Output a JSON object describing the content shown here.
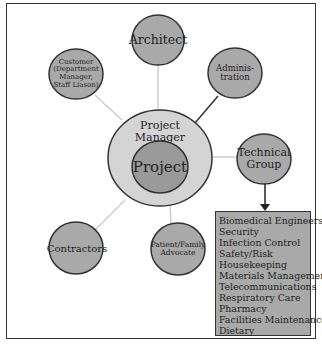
{
  "diagram": {
    "center": {
      "outer_label": "Project Manager",
      "inner_label": "Project"
    },
    "nodes": [
      {
        "id": "architect",
        "label": "Architect"
      },
      {
        "id": "customer",
        "label": "Customer (Department Manager, Staff Liason)"
      },
      {
        "id": "administration",
        "label": "Adminis-tration"
      },
      {
        "id": "technical-group",
        "label": "Technical Group"
      },
      {
        "id": "contractors",
        "label": "Contractors"
      },
      {
        "id": "patient-family-advocate",
        "label": "Patient/Family Advocate"
      }
    ],
    "technical_group_members": [
      "Biomedical Engineers",
      "Security",
      "Infection Control",
      "Safety/Risk",
      "Housekeeping",
      "Materials Management",
      "Telecommunications",
      "Respiratory Care",
      "Pharmacy",
      "Facilities Maintenance",
      "Dietary"
    ],
    "colors": {
      "node_fill": "#a9a9a9",
      "outer_ring_fill": "#d4d4d4",
      "inner_fill": "#9a9a9a",
      "stroke": "#333333",
      "light_line": "#cccccc"
    }
  }
}
